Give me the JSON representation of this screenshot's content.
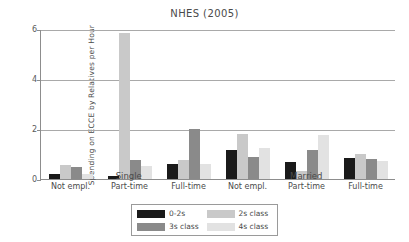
{
  "chart_data": {
    "type": "bar",
    "title": "NHES (2005)",
    "xlabel": "",
    "ylabel": "Spending on ECCE by Relatives per Hour",
    "ylim": [
      0,
      6
    ],
    "yticks": [
      0,
      2,
      4,
      6
    ],
    "ytick_labels": [
      "0",
      "2",
      "4",
      "6"
    ],
    "grid": true,
    "legend_position": "bottom",
    "supergroups": [
      "Single",
      "Married"
    ],
    "categories": [
      "Not empl.",
      "Part-time",
      "Full-time",
      "Not empl.",
      "Part-time",
      "Full-time"
    ],
    "series": [
      {
        "name": "0-2s",
        "color": "#1a1a1a",
        "values": [
          0.2,
          0.13,
          0.62,
          1.15,
          0.7,
          0.85
        ]
      },
      {
        "name": "2s class",
        "color": "#c9c9c9",
        "values": [
          0.56,
          5.85,
          0.78,
          1.82,
          0.32,
          1.0
        ]
      },
      {
        "name": "3s class",
        "color": "#8a8a8a",
        "values": [
          0.47,
          0.78,
          2.0,
          0.9,
          1.18,
          0.8
        ]
      },
      {
        "name": "4s class",
        "color": "#e2e2e2",
        "values": [
          0.2,
          0.52,
          0.62,
          1.25,
          1.75,
          0.72
        ]
      }
    ],
    "legend_entries": [
      {
        "label": "0-2s",
        "color": "#1a1a1a"
      },
      {
        "label": "2s class",
        "color": "#c9c9c9"
      },
      {
        "label": "3s class",
        "color": "#8a8a8a"
      },
      {
        "label": "4s class",
        "color": "#e2e2e2"
      }
    ]
  }
}
